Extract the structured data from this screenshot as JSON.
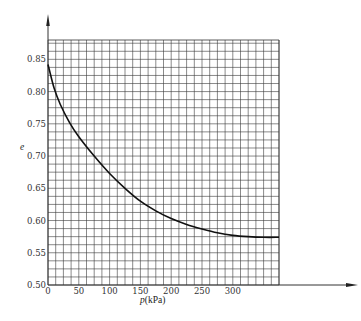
{
  "chart_data": {
    "type": "line",
    "title": "",
    "xlabel": "p(kPa)",
    "xlabel_var": "p",
    "xlabel_unit": "(kPa)",
    "ylabel": "e",
    "xlim": [
      0,
      375
    ],
    "ylim": [
      0.5,
      0.88
    ],
    "grid": true,
    "x_ticks": [
      0,
      50,
      100,
      150,
      200,
      250,
      300
    ],
    "x_tick_labels": [
      "0",
      "50",
      "100",
      "150",
      "200",
      "250",
      "300"
    ],
    "y_ticks": [
      0.5,
      0.55,
      0.6,
      0.65,
      0.7,
      0.75,
      0.8,
      0.85
    ],
    "y_tick_labels": [
      "0.50",
      "0.55",
      "0.60",
      "0.65",
      "0.70",
      "0.75",
      "0.80",
      "0.85"
    ],
    "series": [
      {
        "name": "e-p compression curve",
        "color": "#111111",
        "x": [
          0,
          10,
          20,
          35,
          50,
          75,
          100,
          125,
          150,
          175,
          200,
          225,
          250,
          275,
          300,
          325,
          350,
          375
        ],
        "values": [
          0.842,
          0.805,
          0.78,
          0.752,
          0.73,
          0.7,
          0.673,
          0.65,
          0.63,
          0.615,
          0.603,
          0.594,
          0.587,
          0.581,
          0.577,
          0.575,
          0.574,
          0.574
        ]
      }
    ]
  },
  "colors": {
    "grid": "#3a3a3a",
    "axis": "#333333",
    "curve": "#111111",
    "background": "#ffffff"
  }
}
